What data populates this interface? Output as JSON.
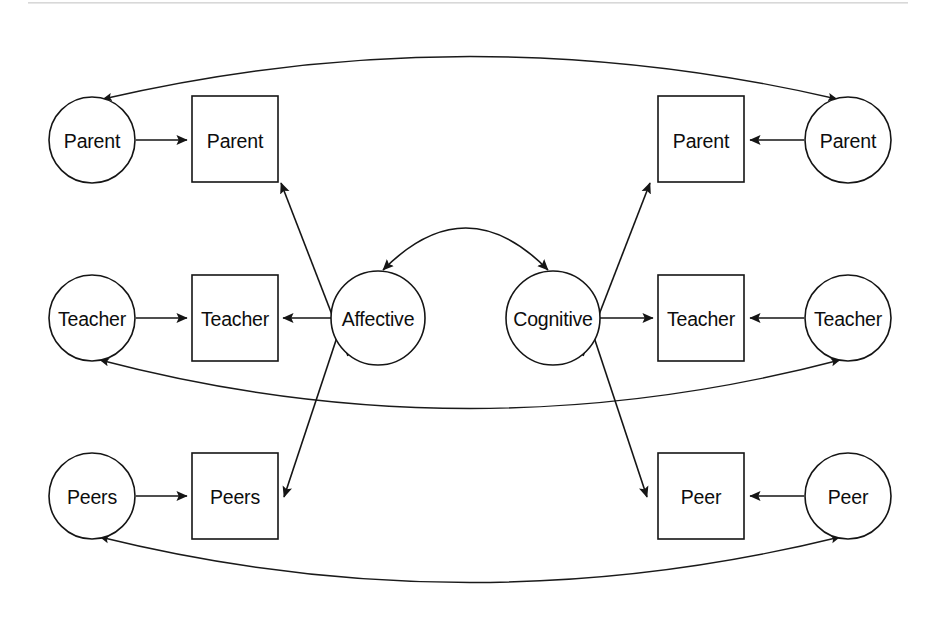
{
  "diagram": {
    "type": "sem-path-diagram",
    "canvas": {
      "width": 939,
      "height": 620,
      "background": "#ffffff"
    },
    "stroke_color": "#151515",
    "latent_shape": "circle",
    "observed_shape": "square",
    "nodes": {
      "left_parent_circle": {
        "label": "Parent",
        "shape": "circle",
        "cx": 92,
        "cy": 140,
        "r": 43
      },
      "left_parent_square": {
        "label": "Parent",
        "shape": "square",
        "x": 192,
        "y": 96,
        "w": 86,
        "h": 86
      },
      "left_teacher_circle": {
        "label": "Teacher",
        "shape": "circle",
        "cx": 92,
        "cy": 318,
        "r": 43
      },
      "left_teacher_square": {
        "label": "Teacher",
        "shape": "square",
        "x": 192,
        "y": 275,
        "w": 86,
        "h": 86
      },
      "left_peers_circle": {
        "label": "Peers",
        "shape": "circle",
        "cx": 92,
        "cy": 496,
        "r": 43
      },
      "left_peers_square": {
        "label": "Peers",
        "shape": "square",
        "x": 192,
        "y": 453,
        "w": 86,
        "h": 86
      },
      "affective_circle": {
        "label": "Affective",
        "shape": "circle",
        "cx": 378,
        "cy": 318,
        "r": 47
      },
      "cognitive_circle": {
        "label": "Cognitive",
        "shape": "circle",
        "cx": 553,
        "cy": 318,
        "r": 47
      },
      "right_parent_square": {
        "label": "Parent",
        "shape": "square",
        "x": 658,
        "y": 96,
        "w": 86,
        "h": 86
      },
      "right_parent_circle": {
        "label": "Parent",
        "shape": "circle",
        "cx": 848,
        "cy": 140,
        "r": 43
      },
      "right_teacher_square": {
        "label": "Teacher",
        "shape": "square",
        "x": 658,
        "y": 275,
        "w": 86,
        "h": 86
      },
      "right_teacher_circle": {
        "label": "Teacher",
        "shape": "circle",
        "cx": 848,
        "cy": 318,
        "r": 43
      },
      "right_peer_square": {
        "label": "Peer",
        "shape": "square",
        "x": 658,
        "y": 453,
        "w": 86,
        "h": 86
      },
      "right_peer_circle": {
        "label": "Peer",
        "shape": "circle",
        "cx": 848,
        "cy": 496,
        "r": 43
      }
    },
    "edges": [
      {
        "name": "left-parent-circle-to-square",
        "from": "left_parent_circle",
        "to": "left_parent_square",
        "style": "straight",
        "arrows": "single"
      },
      {
        "name": "left-teacher-circle-to-square",
        "from": "left_teacher_circle",
        "to": "left_teacher_square",
        "style": "straight",
        "arrows": "single"
      },
      {
        "name": "left-peers-circle-to-square",
        "from": "left_peers_circle",
        "to": "left_peers_square",
        "style": "straight",
        "arrows": "single"
      },
      {
        "name": "right-parent-circle-to-square",
        "from": "right_parent_circle",
        "to": "right_parent_square",
        "style": "straight",
        "arrows": "single"
      },
      {
        "name": "right-teacher-circle-to-square",
        "from": "right_teacher_circle",
        "to": "right_teacher_square",
        "style": "straight",
        "arrows": "single"
      },
      {
        "name": "right-peer-circle-to-square",
        "from": "right_peer_circle",
        "to": "right_peer_square",
        "style": "straight",
        "arrows": "single"
      },
      {
        "name": "affective-to-left-parent-square",
        "from": "affective_circle",
        "to": "left_parent_square",
        "style": "straight",
        "arrows": "single"
      },
      {
        "name": "affective-to-left-teacher-square",
        "from": "affective_circle",
        "to": "left_teacher_square",
        "style": "straight",
        "arrows": "single"
      },
      {
        "name": "affective-to-left-peers-square",
        "from": "affective_circle",
        "to": "left_peers_square",
        "style": "straight",
        "arrows": "single"
      },
      {
        "name": "cognitive-to-right-parent-square",
        "from": "cognitive_circle",
        "to": "right_parent_square",
        "style": "straight",
        "arrows": "single"
      },
      {
        "name": "cognitive-to-right-teacher-square",
        "from": "cognitive_circle",
        "to": "right_teacher_square",
        "style": "straight",
        "arrows": "single"
      },
      {
        "name": "cognitive-to-right-peer-square",
        "from": "cognitive_circle",
        "to": "right_peer_square",
        "style": "straight",
        "arrows": "single"
      },
      {
        "name": "affective-cognitive-correlation",
        "from": "affective_circle",
        "to": "cognitive_circle",
        "style": "curved-up",
        "arrows": "double"
      },
      {
        "name": "parent-parent-correlation",
        "from": "left_parent_circle",
        "to": "right_parent_circle",
        "style": "arc-up",
        "arrows": "double"
      },
      {
        "name": "teacher-teacher-correlation",
        "from": "left_teacher_circle",
        "to": "right_teacher_circle",
        "style": "arc-down",
        "arrows": "double"
      },
      {
        "name": "peers-peer-correlation",
        "from": "left_peers_circle",
        "to": "right_peer_circle",
        "style": "arc-down",
        "arrows": "double"
      }
    ]
  }
}
